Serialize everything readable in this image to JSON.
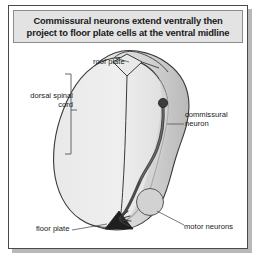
{
  "figure": {
    "title": "Commissural neurons extend ventrally then project to floor plate cells at the ventral midline",
    "title_line_1": "Commissural neurons extend ventrally then",
    "title_line_2": "project to floor plate cells at the ventral midline",
    "labels": {
      "roof_plate": "roof plate",
      "dorsal_spinal_cord": "dorsal spinal cord",
      "commissural_neuron": "commissural neuron",
      "floor_plate": "floor plate",
      "motor_neurons": "motor neurons"
    },
    "colors": {
      "frame_border": "#4a4a4a",
      "title_background": "#e3e3e3",
      "title_border": "#8c8c8c",
      "title_text": "#1a1a1a",
      "cord_fill_light": "#ebebeb",
      "cord_fill_mid": "#d4d4d4",
      "cord_fill_shade": "#c0c0c0",
      "cord_outline": "#3a3a3a",
      "neuron_dark": "#3d3d3d",
      "floor_plate_fill": "#1f1f1f",
      "leader_line": "#555555",
      "page_background": "#ffffff",
      "shadow": "#b8b8b8"
    }
  }
}
